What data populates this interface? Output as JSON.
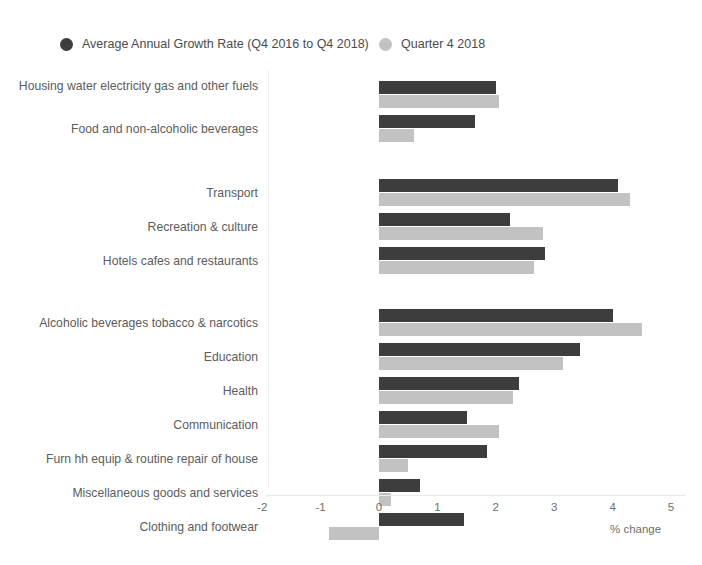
{
  "legend": {
    "items": [
      {
        "label": "Average Annual Growth Rate (Q4 2016 to Q4 2018)",
        "color": "#3d3d3d",
        "icon": "legend-dot-dark"
      },
      {
        "label": "Quarter 4 2018",
        "color": "#c2c2c2",
        "icon": "legend-dot-light"
      }
    ]
  },
  "axis": {
    "title": "% change",
    "ticks": [
      "-2",
      "-1",
      "0",
      "1",
      "2",
      "3",
      "4",
      "5"
    ]
  },
  "chart_data": {
    "type": "bar",
    "orientation": "horizontal",
    "title": "",
    "xlabel": "% change",
    "ylabel": "",
    "xlim": [
      -2,
      5
    ],
    "grid": false,
    "legend_position": "top-left",
    "categories": [
      "Housing water electricity gas and other fuels",
      "Food and non-alcoholic beverages",
      "Transport",
      "Recreation & culture",
      "Hotels cafes and restaurants",
      "Alcoholic beverages tobacco & narcotics",
      "Education",
      "Health",
      "Communication",
      "Furn hh equip & routine repair of house",
      "Miscellaneous goods and services",
      "Clothing and footwear"
    ],
    "groups": [
      {
        "name": "group-1",
        "categories": [
          "Housing water electricity gas and other fuels",
          "Food and non-alcoholic beverages"
        ]
      },
      {
        "name": "group-2",
        "categories": [
          "Transport",
          "Recreation & culture",
          "Hotels cafes and restaurants"
        ]
      },
      {
        "name": "group-3",
        "categories": [
          "Alcoholic beverages tobacco & narcotics",
          "Education",
          "Health",
          "Communication",
          "Furn hh equip & routine repair of house",
          "Miscellaneous goods and services",
          "Clothing and footwear"
        ]
      }
    ],
    "series": [
      {
        "name": "Average Annual Growth Rate (Q4 2016 to Q4 2018)",
        "color": "#3d3d3d",
        "values": [
          2.0,
          1.65,
          4.1,
          2.25,
          2.85,
          4.0,
          3.45,
          2.4,
          1.5,
          1.85,
          0.7,
          1.45
        ]
      },
      {
        "name": "Quarter 4 2018",
        "color": "#c2c2c2",
        "values": [
          2.05,
          0.6,
          4.3,
          2.8,
          2.65,
          4.5,
          3.15,
          2.3,
          2.05,
          0.5,
          0.2,
          -0.85
        ]
      }
    ]
  }
}
